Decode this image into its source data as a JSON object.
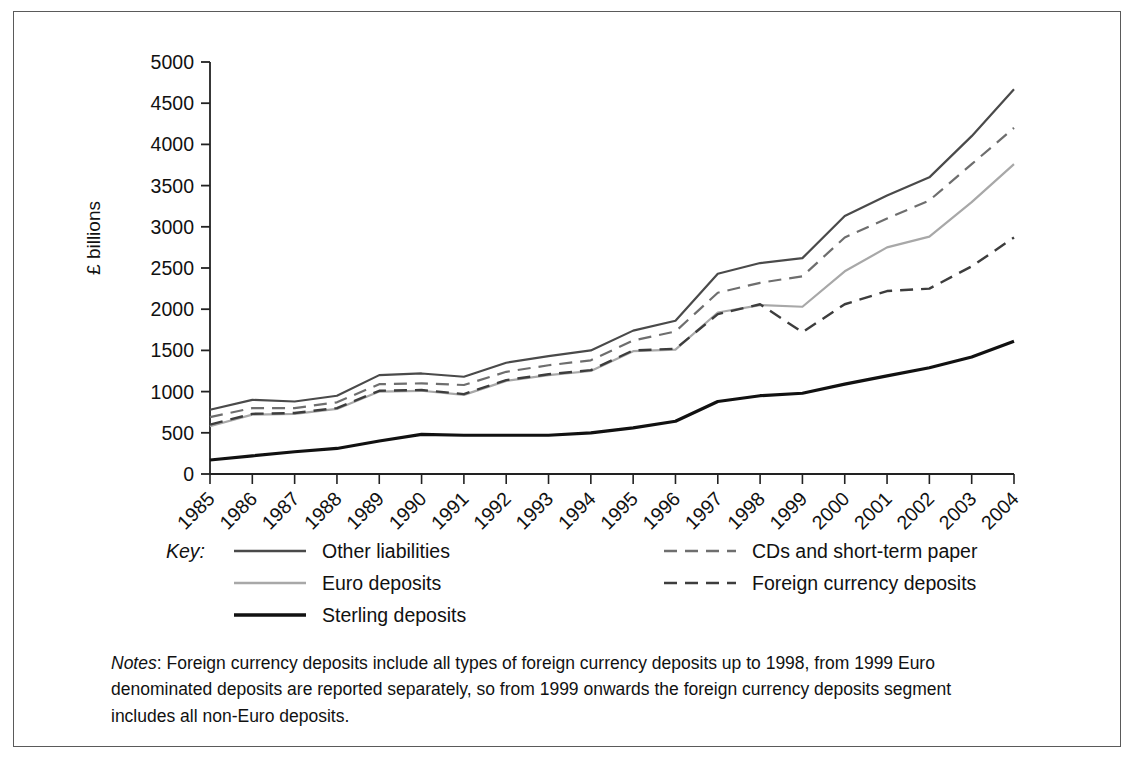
{
  "chart_data": {
    "type": "line",
    "title": "",
    "xlabel": "",
    "ylabel": "£ billions",
    "x": [
      1985,
      1986,
      1987,
      1988,
      1989,
      1990,
      1991,
      1992,
      1993,
      1994,
      1995,
      1996,
      1997,
      1998,
      1999,
      2000,
      2001,
      2002,
      2003,
      2004
    ],
    "categories": [
      "1985",
      "1986",
      "1987",
      "1988",
      "1989",
      "1990",
      "1991",
      "1992",
      "1993",
      "1994",
      "1995",
      "1996",
      "1997",
      "1998",
      "1999",
      "2000",
      "2001",
      "2002",
      "2003",
      "2004"
    ],
    "ylim": [
      0,
      5000
    ],
    "yticks": [
      0,
      500,
      1000,
      1500,
      2000,
      2500,
      3000,
      3500,
      4000,
      4500,
      5000
    ],
    "ytick_labels": [
      "0",
      "500",
      "1000",
      "1500",
      "2000",
      "2500",
      "3000",
      "3500",
      "4000",
      "4500",
      "5000"
    ],
    "grid": false,
    "legend_position": "below-plot",
    "series": [
      {
        "name": "Other liabilities",
        "style": "solid",
        "color": "#4a4a4a",
        "width": 2.2,
        "values": [
          780,
          900,
          880,
          950,
          1200,
          1220,
          1180,
          1350,
          1430,
          1500,
          1740,
          1860,
          2430,
          2560,
          2620,
          3130,
          3380,
          3600,
          4100,
          4670
        ]
      },
      {
        "name": "CDs and short-term paper",
        "style": "dashed",
        "color": "#6e6e6e",
        "width": 2.2,
        "values": [
          690,
          800,
          800,
          870,
          1090,
          1100,
          1080,
          1240,
          1320,
          1380,
          1620,
          1730,
          2200,
          2320,
          2400,
          2870,
          3100,
          3320,
          3760,
          4200
        ]
      },
      {
        "name": "Euro deposits",
        "style": "solid",
        "color": "#a8a8a8",
        "width": 2.2,
        "values": [
          580,
          720,
          730,
          790,
          1000,
          1010,
          960,
          1130,
          1200,
          1250,
          1490,
          1510,
          1960,
          2050,
          2030,
          2460,
          2750,
          2880,
          3300,
          3760
        ]
      },
      {
        "name": "Foreign currency deposits",
        "style": "dashed",
        "color": "#3d3d3d",
        "width": 2.4,
        "values": [
          600,
          730,
          740,
          800,
          1010,
          1020,
          970,
          1140,
          1210,
          1260,
          1500,
          1520,
          1940,
          2060,
          1720,
          2060,
          2220,
          2250,
          2520,
          2870
        ]
      },
      {
        "name": "Sterling deposits",
        "style": "solid",
        "color": "#111111",
        "width": 3.2,
        "values": [
          170,
          220,
          270,
          310,
          400,
          480,
          470,
          470,
          470,
          500,
          560,
          640,
          880,
          950,
          980,
          1090,
          1190,
          1290,
          1420,
          1610
        ]
      }
    ]
  },
  "key": {
    "label": "Key:",
    "entries": [
      {
        "label": "Other liabilities",
        "style": "solid",
        "color": "#4a4a4a",
        "width": 2.4,
        "column": "left",
        "row": 0
      },
      {
        "label": "Euro deposits",
        "style": "solid",
        "color": "#a8a8a8",
        "width": 2.4,
        "column": "left",
        "row": 1
      },
      {
        "label": "Sterling deposits",
        "style": "solid",
        "color": "#111111",
        "width": 3.6,
        "column": "left",
        "row": 2
      },
      {
        "label": "CDs and short-term paper",
        "style": "dashed",
        "color": "#6e6e6e",
        "width": 2.4,
        "column": "right",
        "row": 0
      },
      {
        "label": "Foreign currency deposits",
        "style": "dashed",
        "color": "#3d3d3d",
        "width": 2.6,
        "column": "right",
        "row": 1
      }
    ]
  },
  "notes": {
    "lead": "Notes",
    "separator": ": ",
    "text": "Foreign currency deposits include all types of foreign currency deposits up to 1998, from 1999 Euro denominated deposits are reported separately, so from 1999 onwards the foreign currency deposits segment includes all non-Euro deposits."
  }
}
